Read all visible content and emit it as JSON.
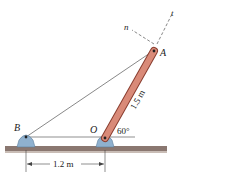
{
  "diagram": {
    "points": {
      "A": "A",
      "B": "B",
      "O": "O"
    },
    "axes": {
      "n": "n",
      "t": "t"
    },
    "dimensions": {
      "bar_length": "1.5 m",
      "base_distance": "1.2 m",
      "angle": "60°"
    },
    "colors": {
      "bar": "#d98a78",
      "bar_outline": "#8a3e30",
      "support": "#8fb1cf",
      "ground": "#8a7770",
      "cable": "#555555"
    }
  }
}
